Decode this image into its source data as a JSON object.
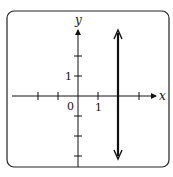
{
  "figure": {
    "type": "coordinate-plane",
    "equation_depicted": "x = 2",
    "axes": {
      "x_label": "x",
      "y_label": "y",
      "origin_label": "0",
      "x_tick_label": "1",
      "y_tick_label": "1",
      "x_ticks": [
        -2,
        -1,
        1,
        2,
        3
      ],
      "y_ticks": [
        2,
        1,
        -1,
        -2,
        -3
      ]
    },
    "line": {
      "orientation": "vertical",
      "x_value": 2,
      "arrows": "both ends"
    },
    "colors": {
      "stroke": "#111111",
      "frame": "#222222",
      "background": "#ffffff"
    }
  }
}
